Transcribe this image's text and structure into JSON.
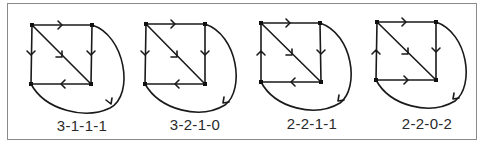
{
  "figure": {
    "frame_color": "#8a8a8a",
    "stroke_color": "#1a1a1a",
    "diagrams": [
      {
        "label": "3-1-1-1",
        "nodes": {
          "tl": [
            32,
            25
          ],
          "tr": [
            92,
            25
          ],
          "bl": [
            31,
            84
          ],
          "br": [
            91,
            84
          ]
        },
        "edges": {
          "top": "tl->tr",
          "left": "tl->bl",
          "diagonal": "tl->br",
          "right": "tr->br",
          "bottom": "br->bl",
          "curve": "bl->tr"
        }
      },
      {
        "label": "3-2-1-0",
        "nodes": {
          "tl": [
            146,
            24
          ],
          "tr": [
            205,
            24
          ],
          "bl": [
            145,
            84
          ],
          "br": [
            205,
            84
          ]
        },
        "edges": {
          "top": "tl->tr",
          "left": "tl->bl",
          "diagonal": "tl->br",
          "right": "tr->br",
          "bottom": "br->bl",
          "curve": "tr->bl"
        }
      },
      {
        "label": "2-2-1-1",
        "nodes": {
          "tl": [
            261,
            23
          ],
          "tr": [
            320,
            23
          ],
          "bl": [
            261,
            82
          ],
          "br": [
            321,
            82
          ]
        },
        "edges": {
          "top": "tl->tr",
          "left": "bl->tl",
          "diagonal": "tl->br",
          "right": "tr->br",
          "bottom": "br->bl",
          "curve": "tr->bl"
        }
      },
      {
        "label": "2-2-0-2",
        "nodes": {
          "tl": [
            377,
            22
          ],
          "tr": [
            436,
            22
          ],
          "bl": [
            376,
            80
          ],
          "br": [
            436,
            80
          ]
        },
        "edges": {
          "top": "tl->tr",
          "left": "bl->tl",
          "diagonal": "tl->br",
          "right": "tr->br",
          "bottom": "bl->br",
          "curve": "tr->bl"
        }
      }
    ]
  }
}
